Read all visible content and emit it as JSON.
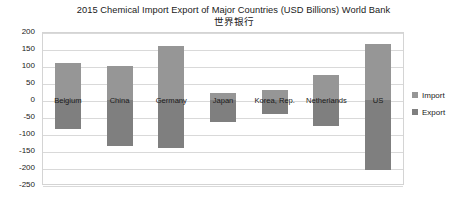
{
  "chart_data": {
    "type": "bar",
    "title": "2015 Chemical Import Export of Major Countries (USD Billions) World Bank",
    "subtitle": "世界银行",
    "xlabel": "",
    "ylabel": "",
    "ylim": [
      -250,
      200
    ],
    "ytick_step": 50,
    "yticks": [
      200,
      150,
      100,
      50,
      0,
      -50,
      -100,
      -150,
      -200,
      -250
    ],
    "ytick_labels": [
      "200",
      "150",
      "100",
      "50",
      "0",
      "-50",
      "-100",
      "-150",
      "-200",
      "-250"
    ],
    "grid": true,
    "legend_position": "right",
    "categories": [
      "Belgium",
      "China",
      "Germany",
      "Japan",
      "Korea, Rep.",
      "Netherlands",
      "US"
    ],
    "series": [
      {
        "name": "Import",
        "color": "#969696",
        "values": [
          110,
          100,
          160,
          20,
          30,
          75,
          165
        ]
      },
      {
        "name": "Export",
        "color": "#7f7f7f",
        "values": [
          -85,
          -135,
          -140,
          -65,
          -40,
          -75,
          -205
        ]
      }
    ]
  },
  "legend": {
    "items": [
      {
        "label": "Import",
        "swatch": "import-swatch"
      },
      {
        "label": "Export",
        "swatch": "export-swatch"
      }
    ]
  }
}
